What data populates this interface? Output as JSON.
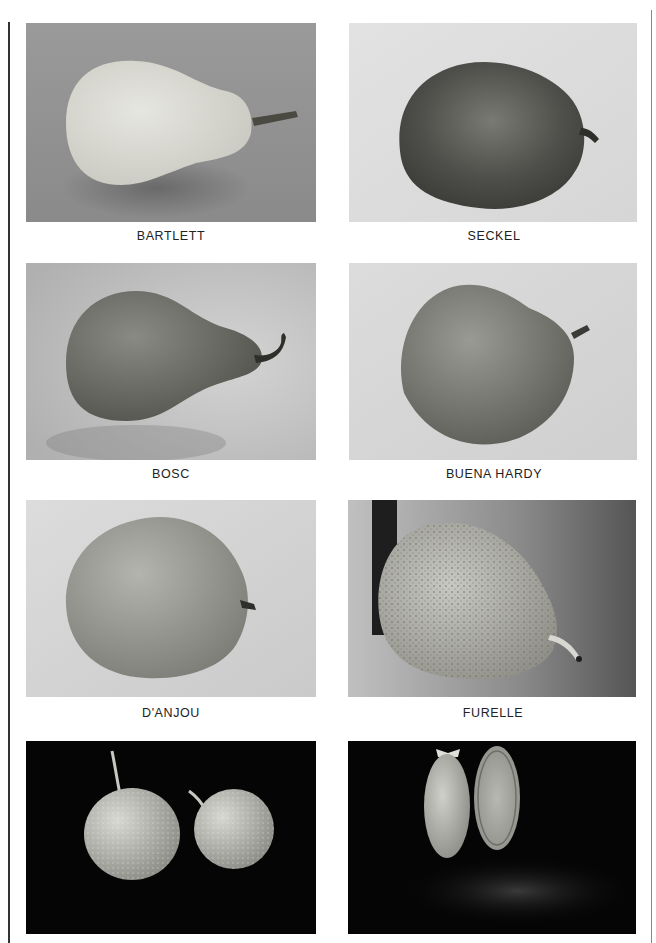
{
  "page": {
    "type": "photo plate",
    "layout": {
      "columns": 2,
      "rows": 4
    }
  },
  "plates": [
    {
      "caption": "BARTLETT",
      "row": 1,
      "col": 1,
      "background": "gray",
      "subject": "light-colored elongated pear with stem pointing right"
    },
    {
      "caption": "SECKEL",
      "row": 1,
      "col": 2,
      "background": "light",
      "subject": "dark, round, textured pear with short stem"
    },
    {
      "caption": "BOSC",
      "row": 2,
      "col": 1,
      "background": "light",
      "subject": "russeted long-necked pear with curved stem"
    },
    {
      "caption": "BUENA HARDY",
      "row": 2,
      "col": 2,
      "background": "light",
      "subject": "broad mottled pear with short stem"
    },
    {
      "caption": "D'ANJOU",
      "row": 3,
      "col": 1,
      "background": "light",
      "subject": "round egg-shaped pear with tiny stem"
    },
    {
      "caption": "FURELLE",
      "row": 3,
      "col": 2,
      "background": "gray gradient",
      "subject": "speckled pear leaning against dark edge, thin stem"
    },
    {
      "caption": "",
      "row": 4,
      "col": 1,
      "background": "black",
      "subject": "two round speckled Asian-type pears with long stems"
    },
    {
      "caption": "",
      "row": 4,
      "col": 2,
      "background": "black",
      "subject": "small pear shown whole and cut in half"
    }
  ]
}
